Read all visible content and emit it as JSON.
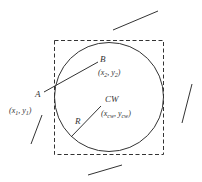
{
  "diagram": {
    "colors": {
      "stroke": "#333333",
      "background": "#ffffff"
    },
    "square": {
      "x": 54,
      "y": 40,
      "width": 109,
      "height": 114,
      "style": "dashed"
    },
    "circle": {
      "cx": 109,
      "cy": 97,
      "r": 54
    },
    "chord_line": {
      "x1": 44,
      "y1": 92,
      "x2": 98,
      "y2": 62
    },
    "radius_line": {
      "x1": 71,
      "y1": 137,
      "x2": 101,
      "y2": 106
    },
    "stray_lines": [
      {
        "x1": 113,
        "y1": 30,
        "x2": 158,
        "y2": 11
      },
      {
        "x1": 182,
        "y1": 123,
        "x2": 192,
        "y2": 84
      },
      {
        "x1": 31,
        "y1": 144,
        "x2": 42,
        "y2": 115
      },
      {
        "x1": 88,
        "y1": 175,
        "x2": 122,
        "y2": 165
      }
    ],
    "labels": {
      "point_a": "A",
      "point_a_coord_open": "(x",
      "point_a_coord_sub1": "1",
      "point_a_coord_mid": ", y",
      "point_a_coord_sub2": "1",
      "point_a_coord_close": ")",
      "point_b": "B",
      "point_b_coord_open": "(x",
      "point_b_coord_sub1": "2",
      "point_b_coord_mid": ", y",
      "point_b_coord_sub2": "2",
      "point_b_coord_close": ")",
      "center": "CW",
      "center_coord_open": "(x",
      "center_coord_sub1": "cw",
      "center_coord_mid": ", y",
      "center_coord_sub2": "cw",
      "center_coord_close": ")",
      "radius": "R"
    }
  }
}
